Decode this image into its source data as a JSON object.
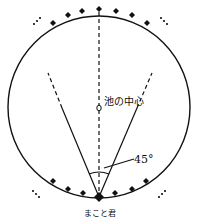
{
  "diagram": {
    "labels": {
      "center": "池の中心",
      "angle": "45°",
      "person": "まこと君",
      "ellipsis": "…"
    },
    "colors": {
      "stroke": "#111111",
      "background": "#ffffff"
    },
    "circle": {
      "cx": 99,
      "cy": 107,
      "r": 91
    },
    "angle_degrees": 45
  }
}
